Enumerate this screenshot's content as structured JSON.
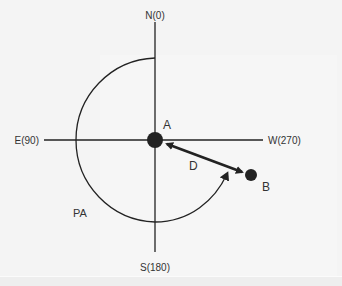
{
  "diagram": {
    "type": "position-angle-diagram",
    "axes": {
      "north": "N(0)",
      "east": "E(90)",
      "south": "S(180)",
      "west": "W(270)"
    },
    "points": {
      "primary": "A",
      "secondary": "B"
    },
    "separation_label": "D",
    "position_angle_label": "PA",
    "colors": {
      "background": "#f4f4f4",
      "ink": "#222222",
      "label": "#333333"
    }
  }
}
